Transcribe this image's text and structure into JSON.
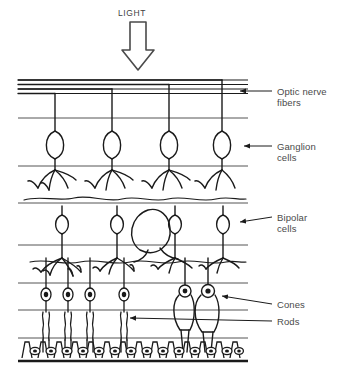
{
  "figure": {
    "light_label": "LIGHT",
    "stroke_color": "#1a1a1a",
    "label_color": "#4a4a4a",
    "background": "#ffffff"
  },
  "labels": [
    {
      "id": "optic-nerve-fibers",
      "line1": "Optic nerve",
      "line2": "fibers",
      "x": 277,
      "y": 86
    },
    {
      "id": "ganglion-cells",
      "line1": "Ganglion",
      "line2": "cells",
      "x": 277,
      "y": 141
    },
    {
      "id": "bipolar-cells",
      "line1": "Bipolar",
      "line2": "cells",
      "x": 277,
      "y": 212
    },
    {
      "id": "cones",
      "line1": "Cones",
      "line2": "",
      "x": 277,
      "y": 299
    },
    {
      "id": "rods",
      "line1": "Rods",
      "line2": "",
      "x": 277,
      "y": 316
    }
  ],
  "layer_lines": {
    "description": "Horizontal boundary lines separating the retinal layers",
    "nerve_fiber_bundles_y": [
      80,
      84.5,
      89,
      93.5
    ],
    "boundaries_y": [
      118,
      166,
      203,
      245,
      283,
      310,
      338,
      360
    ],
    "x_start": 18,
    "x_end": 248
  },
  "cells": {
    "ganglion": {
      "count": 4,
      "x_positions": [
        55,
        112,
        169,
        222
      ],
      "soma_y": 142
    },
    "bipolar": {
      "count": 4,
      "x_positions": [
        62,
        117,
        175,
        223
      ],
      "soma_y": 222
    },
    "amacrine_loop": {
      "x": 142,
      "y": 228
    },
    "rods": {
      "count": 4,
      "x_positions": [
        46,
        68,
        90,
        124
      ]
    },
    "cones": {
      "count": 2,
      "x_positions": [
        185,
        208
      ]
    },
    "pigment_epithelium": {
      "cell_count": 14,
      "x_start": 22,
      "x_end": 244,
      "top_y": 338,
      "bottom_y": 360
    }
  },
  "arrow": {
    "name": "light-direction-arrow",
    "direction": "down",
    "x": 138,
    "top_y": 22,
    "bottom_y": 68
  }
}
